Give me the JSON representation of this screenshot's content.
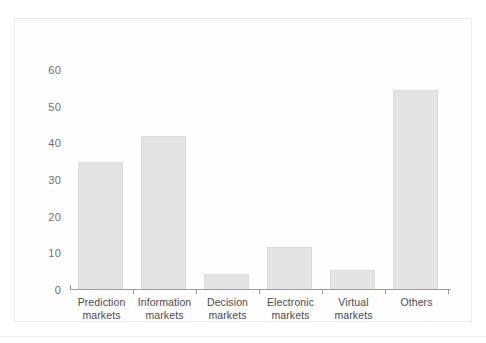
{
  "chart_data": {
    "type": "bar",
    "title": "",
    "subtitle": "",
    "xlabel": "",
    "ylabel": "",
    "categories": [
      "Prediction markets",
      "Information markets",
      "Decision markets",
      "Electronic markets",
      "Virtual markets",
      "Others"
    ],
    "category_lines": [
      [
        "Prediction",
        "markets"
      ],
      [
        "Information",
        "markets"
      ],
      [
        "Decision",
        "markets"
      ],
      [
        "Electronic",
        "markets"
      ],
      [
        "Virtual",
        "markets"
      ],
      [
        "Others"
      ]
    ],
    "values": [
      34.8,
      42,
      4.4,
      11.6,
      5.5,
      54.5
    ],
    "ylim": [
      0,
      63
    ],
    "yticks": [
      0,
      10,
      20,
      30,
      40,
      50,
      60
    ],
    "ytick_labels": [
      "0",
      "10",
      "20",
      "30",
      "40",
      "50",
      "60"
    ],
    "grid": false,
    "legend": null,
    "bar_color": "#e4e4e4",
    "bar_border_color": "#dcdcdc",
    "axis_color": "#9b9b9b",
    "text_color": "#4a4a4a",
    "tick_label_color": "#6e6e6e"
  }
}
